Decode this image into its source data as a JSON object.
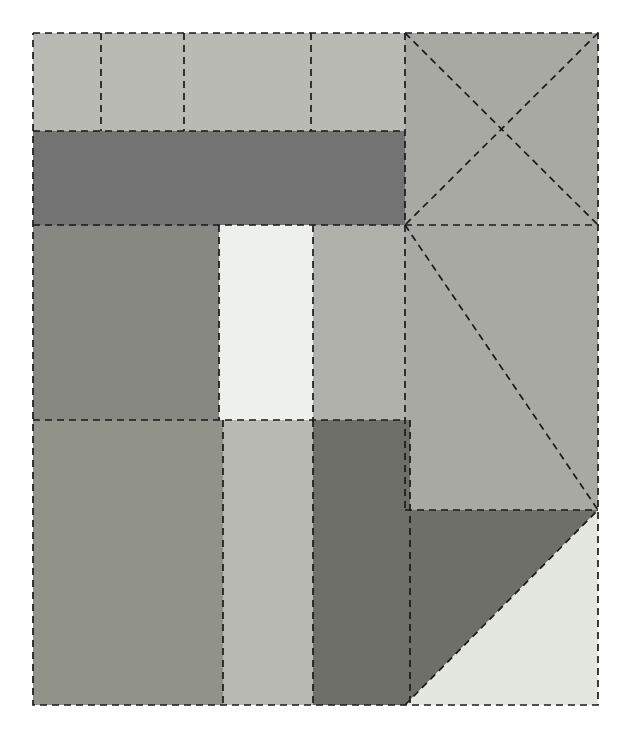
{
  "figure": {
    "canvas": {
      "width": 631,
      "height": 744,
      "background": "#ffffff"
    },
    "bounds": {
      "x0": 33,
      "y0": 33,
      "x1": 598,
      "y1": 705
    },
    "stroke": {
      "color": "#1a1a1a",
      "width": 1.7,
      "dash": "7 5",
      "style": "dashed"
    }
  },
  "palette": {
    "very_light": "#eef0ec",
    "light": "#d7d8d2",
    "light_gray": "#b9bab4",
    "mid_light_gray": "#b0b1ab",
    "mid_gray": "#a8a9a3",
    "gray": "#9a9b95",
    "medium_gray": "#919289",
    "dark_gray": "#878881",
    "dark": "#737373",
    "darker": "#6e6f68",
    "darkest": "#5e5f58"
  },
  "regions": [
    {
      "id": "top-cell-1",
      "name": "top-row-cell-1",
      "shape": "rect",
      "color": "#b9bab4",
      "points": "33,33 101,33 101,131 33,131"
    },
    {
      "id": "top-cell-2",
      "name": "top-row-cell-2",
      "shape": "rect",
      "color": "#b9bab4",
      "points": "101,33 184,33 184,131 101,131"
    },
    {
      "id": "top-cell-3",
      "name": "top-row-cell-3",
      "shape": "rect",
      "color": "#b9bab4",
      "points": "184,33 311,33 311,131 184,131"
    },
    {
      "id": "top-cell-4",
      "name": "top-row-cell-4",
      "shape": "rect",
      "color": "#b9bab4",
      "points": "311,33 405,33 405,131 311,131"
    },
    {
      "id": "top-right-xbox",
      "name": "top-right-crossed-box",
      "shape": "rect",
      "color": "#a8a9a3",
      "points": "405,33 598,33 598,225 405,225"
    },
    {
      "id": "dark-band",
      "name": "horizontal-dark-band",
      "shape": "rect",
      "color": "#737373",
      "points": "33,131 405,131 405,225 33,225"
    },
    {
      "id": "mid-left",
      "name": "middle-left-block",
      "shape": "rect",
      "color": "#878881",
      "points": "33,225 219,225 219,420 33,420"
    },
    {
      "id": "mid-highlight",
      "name": "middle-highlight-block",
      "shape": "rect",
      "color": "#eef0ec",
      "points": "219,225 313,225 313,420 219,420"
    },
    {
      "id": "mid-right",
      "name": "middle-right-block",
      "shape": "rect",
      "color": "#b0b1ab",
      "points": "313,225 405,225 405,420 313,420"
    },
    {
      "id": "right-diag-box",
      "name": "right-diagonal-box",
      "shape": "rect",
      "color": "#a8a9a3",
      "points": "405,225 598,225 598,510 405,510"
    },
    {
      "id": "low-left",
      "name": "lower-left-block",
      "shape": "rect",
      "color": "#919289",
      "points": "33,420 223,420 223,705 33,705"
    },
    {
      "id": "low-mid",
      "name": "lower-middle-block",
      "shape": "rect",
      "color": "#b9bab4",
      "points": "223,420 313,420 313,705 223,705"
    },
    {
      "id": "low-dark",
      "name": "lower-dark-block",
      "shape": "rect",
      "color": "#6e6f68",
      "points": "313,420 410,420 410,705 313,705"
    },
    {
      "id": "corner-triangle-dark",
      "name": "bottom-right-dark-triangle",
      "shape": "triangle",
      "color": "#6e6f68",
      "points": "405,510 598,510 405,705"
    },
    {
      "id": "corner-triangle-light",
      "name": "bottom-right-light-triangle",
      "shape": "triangle",
      "color": "#e4e6e0",
      "points": "598,510 598,705 405,705"
    }
  ],
  "edges": [
    {
      "name": "outer-boundary",
      "type": "rect-path",
      "points": "33,33 598,33 598,705 33,705 33,33"
    },
    {
      "name": "top-row-divider-1",
      "type": "vertical",
      "points": "101,33 101,131"
    },
    {
      "name": "top-row-divider-2",
      "type": "vertical",
      "points": "184,33 184,131"
    },
    {
      "name": "top-row-divider-3",
      "type": "vertical",
      "points": "311,33 311,131"
    },
    {
      "name": "top-row-bottom-edge",
      "type": "horizontal",
      "points": "33,131 405,131"
    },
    {
      "name": "dark-band-bottom-edge",
      "type": "horizontal",
      "points": "33,225 598,225"
    },
    {
      "name": "column-divider-405",
      "type": "vertical",
      "points": "405,33 405,510"
    },
    {
      "name": "column-divider-410-lower",
      "type": "vertical",
      "points": "410,420 410,705"
    },
    {
      "name": "middle-left-divider",
      "type": "vertical",
      "points": "219,225 219,420"
    },
    {
      "name": "middle-right-divider",
      "type": "vertical",
      "points": "313,225 313,420"
    },
    {
      "name": "middle-bottom-edge",
      "type": "horizontal",
      "points": "33,420 405,420"
    },
    {
      "name": "lower-left-divider",
      "type": "vertical",
      "points": "223,420 223,705"
    },
    {
      "name": "lower-right-divider",
      "type": "vertical",
      "points": "313,420 313,705"
    },
    {
      "name": "xbox-diagonal-down",
      "type": "diagonal",
      "points": "405,33 598,225"
    },
    {
      "name": "xbox-diagonal-up",
      "type": "diagonal",
      "points": "598,33 405,225"
    },
    {
      "name": "right-box-diagonal",
      "type": "diagonal",
      "points": "405,225 598,510"
    },
    {
      "name": "corner-antidiagonal",
      "type": "diagonal",
      "points": "405,705 598,510"
    },
    {
      "name": "right-box-bottom-edge",
      "type": "horizontal",
      "points": "405,510 598,510"
    }
  ],
  "summary": {
    "region_count": 15,
    "edge_count": 18,
    "line_style": "dashed",
    "shapes": "rectangles-and-triangles"
  }
}
